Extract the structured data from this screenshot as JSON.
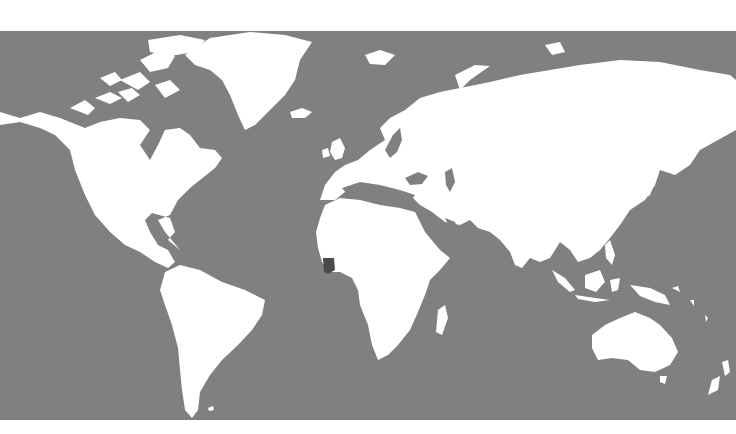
{
  "map": {
    "title": "World map",
    "projection": "equirectangular",
    "ocean_color": "#808080",
    "land_color": "#ffffff",
    "highlight_color": "#4a4a4a",
    "highlighted_country": "Côte d'Ivoire",
    "highlighted_region": "West Africa"
  }
}
